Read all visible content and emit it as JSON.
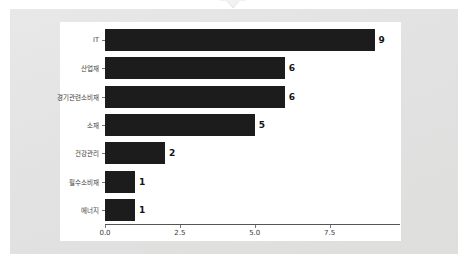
{
  "window": {
    "background_color": "#e4e4e4",
    "card_color": "#ffffff",
    "notch_icon": "chevron-down-notch"
  },
  "chart_data": {
    "type": "bar",
    "orientation": "horizontal",
    "title": "",
    "subtitle": "",
    "xlabel": "",
    "ylabel": "",
    "categories": [
      "IT",
      "산업재",
      "경기관련소비재",
      "소재",
      "건강관리",
      "필수소비재",
      "에너지"
    ],
    "values": [
      9,
      6,
      6,
      5,
      2,
      1,
      1
    ],
    "data_labels": [
      "9",
      "6",
      "6",
      "5",
      "2",
      "1",
      "1"
    ],
    "xticks": [
      0.0,
      2.5,
      5.0,
      7.5
    ],
    "xtick_labels": [
      "0.0",
      "2.5",
      "5.0",
      "7.5"
    ],
    "xlim": [
      0,
      9.85
    ],
    "grid": false,
    "legend": null,
    "bar_color": "#1c1c1c",
    "axis_color": "#555555",
    "tick_label_color": "#3a3a3a"
  }
}
